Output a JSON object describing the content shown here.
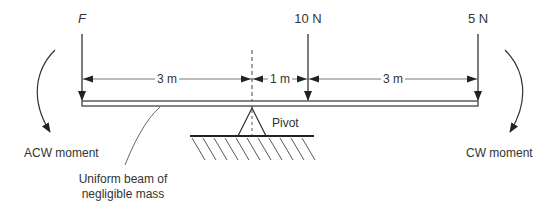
{
  "forces": [
    {
      "label": "F",
      "italic": true,
      "x": 82
    },
    {
      "label": "10 N",
      "x": 308
    },
    {
      "label": "5 N",
      "x": 478
    }
  ],
  "distances": [
    {
      "label": "3 m",
      "from": 82,
      "to": 252
    },
    {
      "label": "1 m",
      "from": 252,
      "to": 308
    },
    {
      "label": "3 m",
      "from": 308,
      "to": 478
    }
  ],
  "labels": {
    "pivot": "Pivot",
    "acw": "ACW moment",
    "cw": "CW moment",
    "beam_line1": "Uniform beam of",
    "beam_line2": "negligible mass"
  },
  "colors": {
    "line": "#333333"
  }
}
